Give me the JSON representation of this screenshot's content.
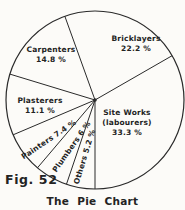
{
  "colors": {
    "ink": "#2a2a2a",
    "background": "#fcfbf8"
  },
  "chart_data": {
    "type": "pie",
    "title": "The Pie Chart",
    "figure_label": "Fig. 52",
    "unit": "%",
    "categories": [
      "Site Works (labourers)",
      "Bricklayers",
      "Carpenters",
      "Plasterers",
      "Painters",
      "Plumbers",
      "Others"
    ],
    "values": [
      33.3,
      22.2,
      14.8,
      11.1,
      7.4,
      6,
      5.2
    ],
    "style": "outline-only unfilled pie, black ink on white, center dot",
    "legend": "none",
    "start_angle_deg": 270,
    "direction": "counterclockwise",
    "geometry": {
      "cx": 95,
      "cy": 100,
      "r": 89,
      "center_dot_r": 1.8
    },
    "slices": [
      {
        "id": "site-works",
        "name": "Site Works (labourers)",
        "value": 33.3,
        "label": {
          "lines": [
            "Site Works",
            "(labourers)",
            "33.3 %"
          ],
          "x": 127,
          "y": 123,
          "rotation": 0
        }
      },
      {
        "id": "bricklayers",
        "name": "Bricklayers",
        "value": 22.2,
        "label": {
          "lines": [
            "Bricklayers",
            "22.2 %"
          ],
          "x": 136,
          "y": 44,
          "rotation": 0
        }
      },
      {
        "id": "carpenters",
        "name": "Carpenters",
        "value": 14.8,
        "label": {
          "lines": [
            "Carpenters",
            "14.8 %"
          ],
          "x": 51,
          "y": 55,
          "rotation": 0
        }
      },
      {
        "id": "plasterers",
        "name": "Plasterers",
        "value": 11.1,
        "label": {
          "lines": [
            "Plasterers",
            "11.1 %"
          ],
          "x": 40,
          "y": 106,
          "rotation": 0
        }
      },
      {
        "id": "painters",
        "name": "Painters",
        "value": 7.4,
        "label": {
          "lines": [
            "Painters 7.4 %"
          ],
          "x": 49,
          "y": 140,
          "rotation": -34
        }
      },
      {
        "id": "plumbers",
        "name": "Plumbers",
        "value": 6,
        "label": {
          "lines": [
            "Plumbers 6 %"
          ],
          "x": 72,
          "y": 147,
          "rotation": -55
        }
      },
      {
        "id": "others",
        "name": "Others",
        "value": 5.2,
        "label": {
          "lines": [
            "Others 5.2 %"
          ],
          "x": 85,
          "y": 157,
          "rotation": -73
        }
      }
    ]
  }
}
